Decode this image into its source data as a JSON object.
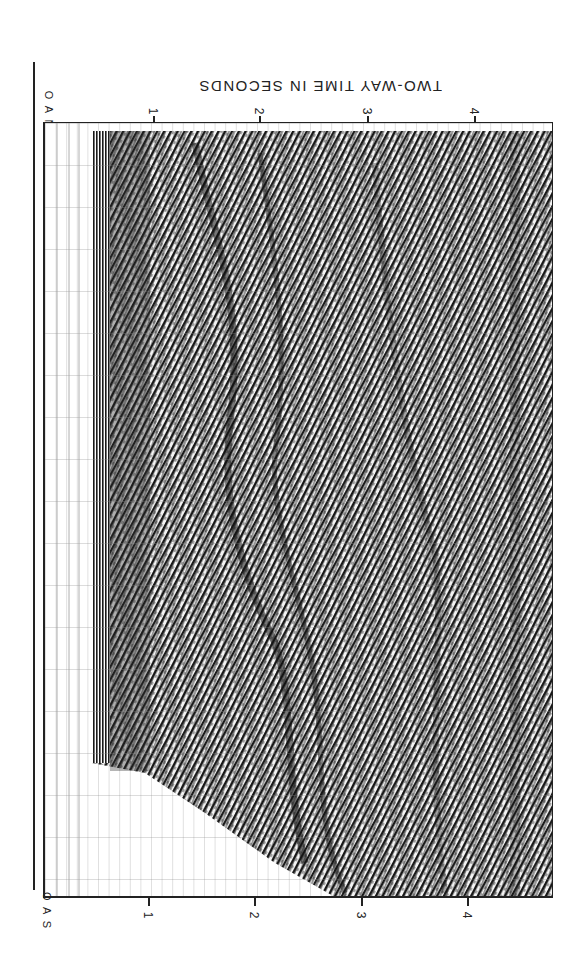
{
  "figure": {
    "title": "TWO-WAY TIME IN SECONDS",
    "top_axis": {
      "corner_label": "O A N",
      "ticks": [
        {
          "label": "1",
          "x": 153
        },
        {
          "label": "2",
          "x": 259
        },
        {
          "label": "3",
          "x": 367
        },
        {
          "label": "4",
          "x": 474
        }
      ]
    },
    "bottom_axis": {
      "corner_label": "O A S",
      "ticks": [
        {
          "label": "1",
          "x": 148
        },
        {
          "label": "2",
          "x": 254
        },
        {
          "label": "3",
          "x": 361
        },
        {
          "label": "4",
          "x": 467
        }
      ]
    },
    "panel": {
      "description": "Seismic reflection profile (rotated 90°), two-way travel time 0–4.5 s",
      "ink_color": "#1a1a1a",
      "paper_color": "#ffffff"
    }
  }
}
